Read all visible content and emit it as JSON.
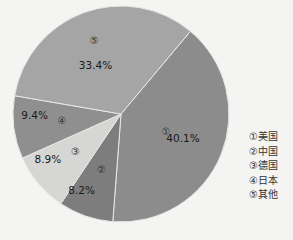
{
  "chart_data": {
    "type": "pie",
    "title": "",
    "categories": [
      "美国",
      "中国",
      "德国",
      "日本",
      "其他"
    ],
    "markers": [
      "①",
      "②",
      "③",
      "④",
      "⑤"
    ],
    "values": [
      40.1,
      8.2,
      8.9,
      9.4,
      33.4
    ],
    "labels": [
      "40.1%",
      "8.2%",
      "8.9%",
      "9.4%",
      "33.4%"
    ],
    "colors": [
      "#8c8c8c",
      "#7d7d7d",
      "#d6d6d4",
      "#8f8f8f",
      "#a5a5a5"
    ],
    "start_angle_deg": 40,
    "direction": "clockwise",
    "legend_position": "right"
  },
  "legend": {
    "items": [
      {
        "marker": "①",
        "label": "美国"
      },
      {
        "marker": "②",
        "label": "中国"
      },
      {
        "marker": "③",
        "label": "德国"
      },
      {
        "marker": "④",
        "label": "日本"
      },
      {
        "marker": "⑤",
        "label": "其他"
      }
    ]
  }
}
